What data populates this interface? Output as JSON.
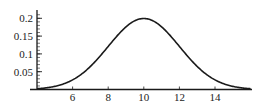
{
  "chart_data": {
    "type": "line",
    "title": "",
    "xlabel": "",
    "ylabel": "",
    "series": [
      {
        "name": "normal-pdf",
        "mean": 10,
        "sd": 2,
        "x": [
          4,
          5,
          6,
          7,
          8,
          9,
          10,
          11,
          12,
          13,
          14,
          15,
          16
        ],
        "values": [
          0.0022,
          0.0088,
          0.027,
          0.0648,
          0.121,
          0.176,
          0.1995,
          0.176,
          0.121,
          0.0648,
          0.027,
          0.0088,
          0.0022
        ]
      }
    ],
    "xlim": [
      4,
      16
    ],
    "ylim": [
      0,
      0.21
    ],
    "x_ticks": [
      6,
      8,
      10,
      12,
      14
    ],
    "x_tick_labels": [
      "6",
      "8",
      "10",
      "12",
      "14"
    ],
    "y_ticks": [
      0.05,
      0.1,
      0.15,
      0.2
    ],
    "y_tick_labels": [
      "0.05",
      "0.1",
      "0.15",
      "0.2"
    ],
    "y_minor_tick_step": 0.01,
    "grid": false,
    "legend": null,
    "colors": {
      "line": "#1a1a1a",
      "axis": "#1a1a1a",
      "background": "#ffffff"
    }
  }
}
